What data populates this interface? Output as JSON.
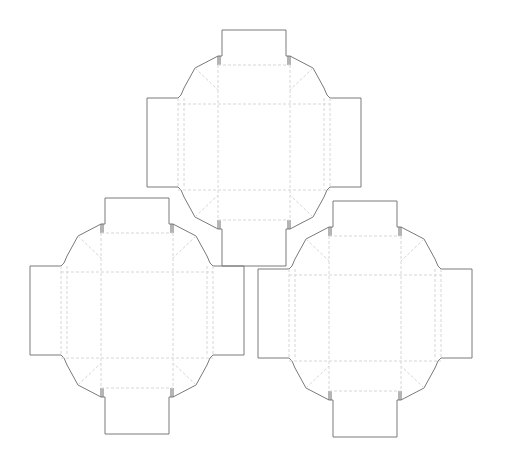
{
  "diagram": {
    "type": "box-dieline-sheet",
    "colors": {
      "cut_line": "#7a7a7a",
      "fold_line": "#d6d6d6",
      "background": "#ffffff"
    },
    "dielines": [
      {
        "id": "top",
        "x": 147,
        "y": 30
      },
      {
        "id": "bottom-left",
        "x": 30,
        "y": 198
      },
      {
        "id": "bottom-right",
        "x": 258,
        "y": 201
      }
    ]
  }
}
